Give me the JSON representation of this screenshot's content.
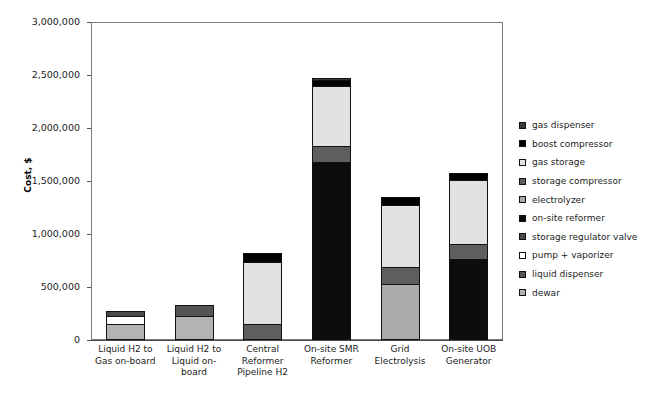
{
  "chart_data": {
    "type": "bar",
    "subtype": "stacked-bar",
    "title": "",
    "xlabel": "",
    "ylabel": "Cost, $",
    "ylim": [
      0,
      3000000
    ],
    "ytick_values": [
      0,
      500000,
      1000000,
      1500000,
      2000000,
      2500000,
      3000000
    ],
    "ytick_labels": [
      "0",
      "500,000",
      "1,000,000",
      "1,500,000",
      "2,000,000",
      "2,500,000",
      "3,000,000"
    ],
    "grid": false,
    "legend_position": "right",
    "categories": [
      "Liquid H2 to Gas on-board",
      "Liquid H2 to Liquid on-board",
      "Central Reformer Pipeline H2",
      "On-site SMR Reformer",
      "Grid Electrolysis",
      "On-site UOB Generator"
    ],
    "category_lines": [
      [
        "Liquid H2 to",
        "Gas on-board"
      ],
      [
        "Liquid H2 to",
        "Liquid on-board"
      ],
      [
        "Central",
        "Reformer",
        "Pipeline H2"
      ],
      [
        "On-site SMR",
        "Reformer"
      ],
      [
        "Grid",
        "Electrolysis"
      ],
      [
        "On-site UOB",
        "Generator"
      ]
    ],
    "series": [
      {
        "name": "dewar",
        "key": "dewar",
        "color": "#b3b3b3",
        "values": [
          150000,
          230000,
          0,
          0,
          0,
          0
        ]
      },
      {
        "name": "liquid dispenser",
        "key": "liquid-disp",
        "color": "#545454",
        "values": [
          0,
          105000,
          0,
          0,
          0,
          0
        ]
      },
      {
        "name": "pump + vaporizer",
        "key": "pump-vap",
        "color": "#ffffff",
        "values": [
          75000,
          0,
          0,
          0,
          0,
          0
        ]
      },
      {
        "name": "storage regulator valve",
        "key": "stor-reg",
        "color": "#4a4a4a",
        "values": [
          50000,
          0,
          0,
          0,
          0,
          0
        ]
      },
      {
        "name": "on-site reformer",
        "key": "onsite-ref",
        "color": "#0d0d0d",
        "values": [
          0,
          0,
          0,
          1680000,
          0,
          760000
        ]
      },
      {
        "name": "electrolyzer",
        "key": "electrolyzer",
        "color": "#ababab",
        "values": [
          0,
          0,
          0,
          0,
          530000,
          0
        ]
      },
      {
        "name": "storage compressor",
        "key": "stor-comp",
        "color": "#5e5e5e",
        "values": [
          0,
          0,
          155000,
          150000,
          155000,
          150000
        ]
      },
      {
        "name": "gas storage",
        "key": "gas-storage",
        "color": "#e2e2e2",
        "values": [
          0,
          0,
          580000,
          570000,
          590000,
          600000
        ]
      },
      {
        "name": "boost compressor",
        "key": "boost-comp",
        "color": "#000000",
        "values": [
          0,
          0,
          85000,
          55000,
          75000,
          70000
        ]
      },
      {
        "name": "gas dispenser",
        "key": "gas-disp",
        "color": "#3a3a3a",
        "values": [
          0,
          0,
          0,
          20000,
          0,
          0
        ]
      }
    ],
    "totals": [
      275000,
      335000,
      820000,
      2475000,
      1350000,
      1580000
    ]
  },
  "legend": {
    "items": [
      {
        "label": "gas dispenser",
        "key": "gas-disp"
      },
      {
        "label": "boost compressor",
        "key": "boost-comp"
      },
      {
        "label": "gas storage",
        "key": "gas-storage"
      },
      {
        "label": "storage compressor",
        "key": "stor-comp"
      },
      {
        "label": "electrolyzer",
        "key": "electrolyzer"
      },
      {
        "label": "on-site reformer",
        "key": "onsite-ref"
      },
      {
        "label": "storage regulator valve",
        "key": "stor-reg"
      },
      {
        "label": "pump + vaporizer",
        "key": "pump-vap"
      },
      {
        "label": "liquid dispenser",
        "key": "liquid-disp"
      },
      {
        "label": "dewar",
        "key": "dewar"
      }
    ]
  }
}
